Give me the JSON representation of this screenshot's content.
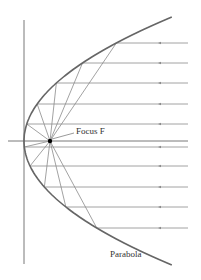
{
  "diagram": {
    "type": "parabolic-reflector",
    "labels": {
      "focus": "Focus F",
      "curve": "Parabola"
    },
    "colors": {
      "curve": "#666666",
      "rays": "#8a8a8a",
      "axes": "#555555",
      "focus_point": "#000000"
    },
    "vertex": [
      24,
      141
    ],
    "focus": [
      50,
      141
    ],
    "ray_y_positions": [
      43,
      63,
      83,
      104,
      124,
      147,
      166,
      187,
      207,
      228
    ]
  }
}
